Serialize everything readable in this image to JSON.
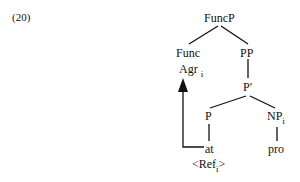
{
  "example_number": "(20)",
  "tree": {
    "root": "FuncP",
    "func": "Func",
    "agr": {
      "label": "Agr",
      "index": "i"
    },
    "pp": "PP",
    "p_bar": "P′",
    "p": "P",
    "np": {
      "label": "NP",
      "index": "i"
    },
    "at": "at",
    "pro": "pro",
    "ref": {
      "open": "<Ref",
      "index": "i",
      "close": ">"
    }
  },
  "arrow": {
    "from": "at",
    "to": "Agr",
    "style": "filled-triangle-head"
  }
}
